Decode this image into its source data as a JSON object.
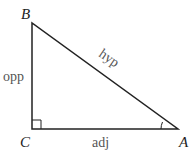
{
  "diagram": {
    "type": "right-triangle",
    "vertices": [
      {
        "id": "B",
        "label": "B"
      },
      {
        "id": "C",
        "label": "C"
      },
      {
        "id": "A",
        "label": "A"
      }
    ],
    "sides": {
      "opposite": "opp",
      "adjacent": "adj",
      "hypotenuse": "hyp"
    },
    "right_angle_at": "C",
    "marked_angle_at": "A",
    "colors": {
      "lines": "#222222",
      "side_labels": "#555555"
    }
  }
}
